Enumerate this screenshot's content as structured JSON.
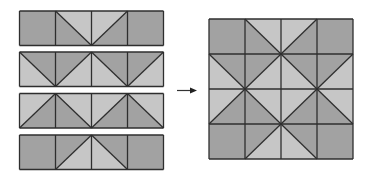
{
  "colors": {
    "dark": "#a2a2a2",
    "light": "#c6c6c6",
    "line": "#2e2e2e",
    "background": "#ffffff"
  },
  "strips": [
    {
      "name": "strip-1",
      "cells": [
        {
          "type": "solid",
          "fill": "dark"
        },
        {
          "type": "diag",
          "diag": "tlbr",
          "upper": "light",
          "lower": "dark"
        },
        {
          "type": "diag",
          "diag": "bltr",
          "upper": "light",
          "lower": "dark"
        },
        {
          "type": "solid",
          "fill": "dark"
        }
      ]
    },
    {
      "name": "strip-2",
      "cells": [
        {
          "type": "diag",
          "diag": "tlbr",
          "upper": "dark",
          "lower": "light"
        },
        {
          "type": "diag",
          "diag": "bltr",
          "upper": "dark",
          "lower": "light"
        },
        {
          "type": "diag",
          "diag": "tlbr",
          "upper": "dark",
          "lower": "light"
        },
        {
          "type": "diag",
          "diag": "bltr",
          "upper": "dark",
          "lower": "light"
        }
      ]
    },
    {
      "name": "strip-3",
      "cells": [
        {
          "type": "diag",
          "diag": "bltr",
          "upper": "light",
          "lower": "dark"
        },
        {
          "type": "diag",
          "diag": "tlbr",
          "upper": "light",
          "lower": "dark"
        },
        {
          "type": "diag",
          "diag": "bltr",
          "upper": "light",
          "lower": "dark"
        },
        {
          "type": "diag",
          "diag": "tlbr",
          "upper": "light",
          "lower": "dark"
        }
      ]
    },
    {
      "name": "strip-4",
      "cells": [
        {
          "type": "solid",
          "fill": "dark"
        },
        {
          "type": "diag",
          "diag": "bltr",
          "upper": "dark",
          "lower": "light"
        },
        {
          "type": "diag",
          "diag": "tlbr",
          "upper": "dark",
          "lower": "light"
        },
        {
          "type": "solid",
          "fill": "dark"
        }
      ]
    }
  ],
  "layout": {
    "left_strips": {
      "x": 19.5,
      "cell_w": 36,
      "cell_h": 34.5,
      "ys": [
        11,
        52,
        93.5,
        135
      ]
    },
    "arrow": {
      "x1": 177,
      "x2": 197,
      "y": 90.5
    },
    "right_grid": {
      "x": 209,
      "y": 19,
      "cell_w": 36,
      "cell_h": 35
    }
  }
}
